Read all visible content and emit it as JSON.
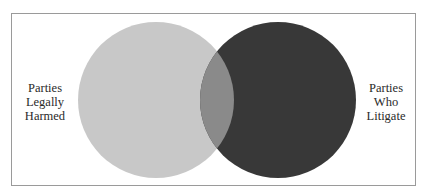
{
  "diagram": {
    "type": "venn",
    "sets": [
      {
        "id": "legally-harmed",
        "label_lines": [
          "Parties",
          "Legally",
          "Harmed"
        ],
        "color": "#c8c8c8",
        "position": "left"
      },
      {
        "id": "litigate",
        "label_lines": [
          "Parties",
          "Who",
          "Litigate"
        ],
        "color": "#383838",
        "position": "right"
      }
    ],
    "overlap_color": "#8a8a8a",
    "frame_color": "#9a9a9a"
  }
}
